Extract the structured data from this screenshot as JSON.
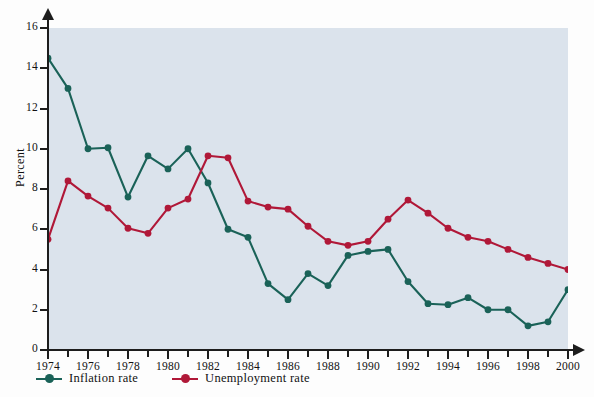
{
  "chart_data": {
    "type": "line",
    "title": "",
    "xlabel": "",
    "ylabel": "Percent",
    "xlim": [
      1974,
      2000
    ],
    "ylim": [
      0,
      16
    ],
    "ytick_step": 2,
    "xtick_step": 2,
    "minor_xtick_step": 1,
    "grid": false,
    "legend_position": "below-left",
    "x": [
      1974,
      1975,
      1976,
      1977,
      1978,
      1979,
      1980,
      1981,
      1982,
      1983,
      1984,
      1985,
      1986,
      1987,
      1988,
      1989,
      1990,
      1991,
      1992,
      1993,
      1994,
      1995,
      1996,
      1997,
      1998,
      1999,
      2000
    ],
    "ytick_labels": [
      "0",
      "2",
      "4",
      "6",
      "8",
      "10",
      "12",
      "14",
      "16"
    ],
    "xtick_labels": [
      "1974",
      "1976",
      "1978",
      "1980",
      "1982",
      "1984",
      "1986",
      "1988",
      "1990",
      "1992",
      "1994",
      "1996",
      "1998",
      "2000"
    ],
    "series": [
      {
        "name": "Inflation rate",
        "color": "#1a6258",
        "values": [
          14.5,
          13.0,
          10.0,
          10.05,
          7.6,
          9.65,
          9.0,
          10.0,
          8.3,
          6.0,
          5.6,
          3.3,
          2.5,
          3.8,
          3.2,
          4.7,
          4.9,
          5.0,
          3.4,
          2.3,
          2.25,
          2.6,
          2.0,
          2.0,
          1.2,
          1.4,
          3.0
        ]
      },
      {
        "name": "Unemployment rate",
        "color": "#b01838",
        "values": [
          5.5,
          8.4,
          7.65,
          7.05,
          6.05,
          5.8,
          7.05,
          7.5,
          9.65,
          9.55,
          7.4,
          7.1,
          7.0,
          6.15,
          5.4,
          5.2,
          5.4,
          6.5,
          7.45,
          6.8,
          6.05,
          5.6,
          5.4,
          5.0,
          4.6,
          4.3,
          4.0
        ]
      }
    ]
  },
  "legend": {
    "items": [
      {
        "label": "Inflation rate",
        "color": "#1a6258",
        "marker": "circle-line-marker"
      },
      {
        "label": "Unemployment rate",
        "color": "#b01838",
        "marker": "circle-line-marker"
      }
    ]
  },
  "axes": {
    "y_title": "Percent",
    "y_arrow_icon": "arrow-up-icon",
    "x_arrow_icon": "arrow-right-icon"
  },
  "colors": {
    "plot_background": "#dbe3ec",
    "figure_background": "#fdfdfd",
    "axis": "#1d1d1d",
    "inflation": "#1a6258",
    "unemployment": "#b01838"
  }
}
